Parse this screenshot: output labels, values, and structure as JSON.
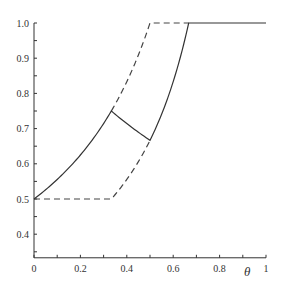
{
  "chart_data": {
    "type": "line",
    "title": "",
    "xlabel": "θ",
    "ylabel": "",
    "xlim": [
      0,
      1
    ],
    "ylim": [
      0.333,
      1.0
    ],
    "grid": false,
    "legend": null,
    "x_ticks": [
      "0",
      "0.2",
      "0.4",
      "0.6",
      "0.8",
      "1"
    ],
    "y_ticks": [
      "0.4",
      "0.5",
      "0.6",
      "0.7",
      "0.8",
      "0.9",
      "1.0"
    ],
    "series": [
      {
        "name": "upper dashed bound",
        "style": "dashed",
        "x": [
          0,
          0.1,
          0.2,
          0.3333,
          0.4,
          0.45,
          0.5,
          0.6667
        ],
        "values": [
          0.5,
          0.556,
          0.625,
          0.75,
          0.833,
          0.909,
          1.0,
          1.0
        ]
      },
      {
        "name": "lower dashed bound",
        "style": "dashed",
        "x": [
          0,
          0.3333,
          0.4,
          0.5,
          0.55,
          0.6,
          0.6667
        ],
        "values": [
          0.5,
          0.5,
          0.556,
          0.667,
          0.741,
          0.833,
          1.0
        ]
      },
      {
        "name": "solid curve",
        "style": "solid",
        "x": [
          0,
          0.1,
          0.2,
          0.3333,
          0.4,
          0.45,
          0.5,
          0.55,
          0.6,
          0.6667,
          0.8,
          1.0
        ],
        "values": [
          0.5,
          0.556,
          0.625,
          0.75,
          0.714,
          0.69,
          0.667,
          0.741,
          0.833,
          1.0,
          1.0,
          1.0
        ]
      }
    ]
  }
}
